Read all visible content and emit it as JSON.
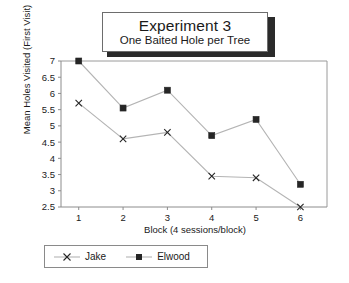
{
  "title": {
    "main": "Experiment 3",
    "sub": "One Baited Hole per Tree"
  },
  "axes": {
    "ylabel": "Mean Holes Visited (First Visit)",
    "xlabel": "Block (4 sessions/block)"
  },
  "legend": {
    "jake_label": "Jake",
    "elwood_label": "Elwood"
  },
  "chart_data": {
    "type": "line",
    "title": "Experiment 3",
    "subtitle": "One Baited Hole per Tree",
    "xlabel": "Block (4 sessions/block)",
    "ylabel": "Mean Holes Visited (First Visit)",
    "x": [
      1,
      2,
      3,
      4,
      5,
      6
    ],
    "categories": [
      "1",
      "2",
      "3",
      "4",
      "5",
      "6"
    ],
    "xtick_labels": [
      "1",
      "2",
      "3",
      "4",
      "5",
      "6"
    ],
    "ytick_labels": [
      "2.5",
      "3",
      "3.5",
      "4",
      "4.5",
      "5",
      "5.5",
      "6",
      "6.5",
      "7"
    ],
    "yticks": [
      2.5,
      3,
      3.5,
      4,
      4.5,
      5,
      5.5,
      6,
      6.5,
      7
    ],
    "ylim": [
      2.5,
      7
    ],
    "xlim": [
      0.6,
      6.6
    ],
    "grid": false,
    "legend_position": "bottom-left",
    "series": [
      {
        "name": "Jake",
        "marker": "x",
        "color": "#262626",
        "values": [
          5.7,
          4.6,
          4.8,
          3.45,
          3.4,
          2.5
        ]
      },
      {
        "name": "Elwood",
        "marker": "square",
        "color": "#262626",
        "values": [
          7.0,
          5.55,
          6.1,
          4.7,
          5.2,
          3.2
        ]
      }
    ]
  }
}
